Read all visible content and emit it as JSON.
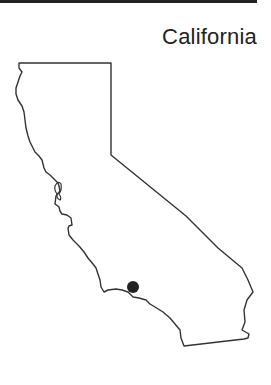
{
  "map": {
    "title": "California",
    "outline_color": "#333333",
    "marker": {
      "label": "location-marker",
      "color": "#222222"
    }
  }
}
